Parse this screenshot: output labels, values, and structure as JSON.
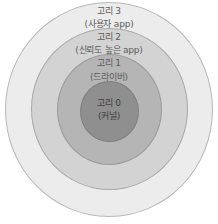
{
  "diagram": {
    "type": "concentric-rings",
    "rings": [
      {
        "name": "ring-3",
        "title": "고리 3",
        "subtitle": "(사용자 app)",
        "color": "#ececec",
        "border": "#b8b8b8"
      },
      {
        "name": "ring-2",
        "title": "고리 2",
        "subtitle": "(신뢰도 높은 app)",
        "color": "#d3d3d3",
        "border": "#a8a8a8"
      },
      {
        "name": "ring-1",
        "title": "고리 1",
        "subtitle": "(드라이버)",
        "color": "#b5b5b5",
        "border": "#9a9a9a"
      },
      {
        "name": "ring-0",
        "title": "고리 0",
        "subtitle": "(커널)",
        "color": "#8f8f8f",
        "border": "#7e7e7e"
      }
    ]
  }
}
